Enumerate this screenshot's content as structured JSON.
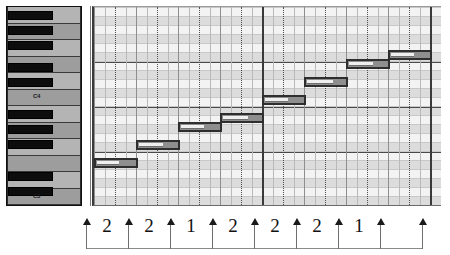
{
  "app": {
    "title": "MIDI Piano Roll Editor",
    "view": "piano-roll"
  },
  "keyboard": {
    "label_c4": "C4",
    "label_c3": "C3",
    "white_key_count": 12,
    "black_key_count": 9
  },
  "grid": {
    "background_color": "#f3f3f3",
    "row_shade_color": "#dcdcdc",
    "bar_line_color": "#3a3a3a",
    "beat_line_color": "#b9b9b9",
    "octave_line_color": "#4a4a4a"
  },
  "notes": {
    "fill_color": "#8e8e8e",
    "border_color": "#2e2e2e",
    "items": [
      {
        "name": "C3",
        "left": 0,
        "top": 151,
        "width": 44,
        "vel": 0.58
      },
      {
        "name": "D3",
        "left": 42,
        "top": 133,
        "width": 44,
        "vel": 0.62
      },
      {
        "name": "E3",
        "left": 84,
        "top": 115,
        "width": 44,
        "vel": 0.6
      },
      {
        "name": "F3",
        "left": 126,
        "top": 106,
        "width": 44,
        "vel": 0.66
      },
      {
        "name": "G3",
        "left": 168,
        "top": 88,
        "width": 44,
        "vel": 0.6
      },
      {
        "name": "A3",
        "left": 210,
        "top": 70,
        "width": 44,
        "vel": 0.68
      },
      {
        "name": "B3",
        "left": 252,
        "top": 52,
        "width": 44,
        "vel": 0.62
      },
      {
        "name": "C4",
        "left": 294,
        "top": 43,
        "width": 44,
        "vel": 0.6
      }
    ]
  },
  "ruler": {
    "caption": "semitone intervals of the major scale",
    "ticks": [
      0,
      42,
      84,
      126,
      168,
      210,
      252,
      294
    ],
    "intervals": [
      {
        "label": "2",
        "left": 0,
        "width": 42
      },
      {
        "label": "2",
        "left": 42,
        "width": 42
      },
      {
        "label": "1",
        "left": 84,
        "width": 42
      },
      {
        "label": "2",
        "left": 126,
        "width": 42
      },
      {
        "label": "2",
        "left": 168,
        "width": 42
      },
      {
        "label": "2",
        "left": 210,
        "width": 42
      },
      {
        "label": "1",
        "left": 252,
        "width": 42
      }
    ]
  }
}
